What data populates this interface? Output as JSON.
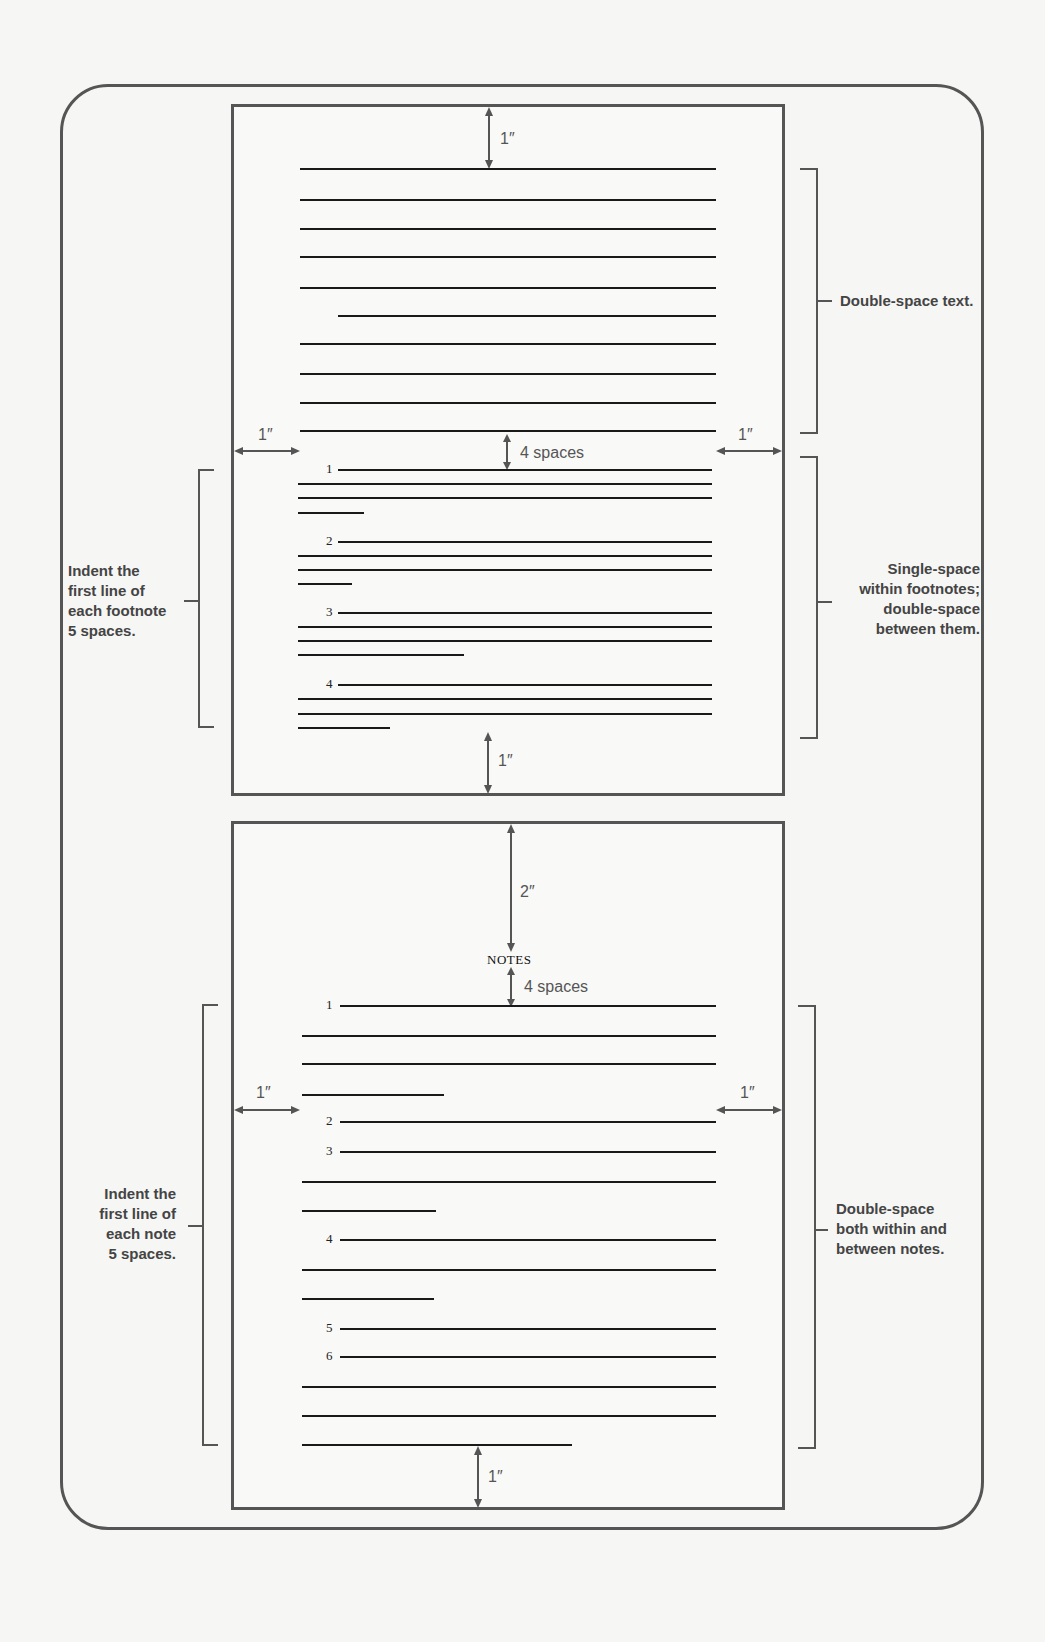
{
  "diagram": {
    "type": "manuscript-page-layout",
    "top_page": {
      "top_margin_label": "1″",
      "bottom_margin_label": "1″",
      "left_margin_label": "1″",
      "right_margin_label": "1″",
      "gap_label": "4 spaces",
      "footnote_numbers": [
        "1",
        "2",
        "3",
        "4"
      ],
      "right_annotation_top": "Double-space text.",
      "right_annotation_bottom": [
        "Single-space",
        "within footnotes;",
        "double-space",
        "between them."
      ],
      "left_annotation": [
        "Indent the",
        "first line of",
        "each footnote",
        "5 spaces."
      ]
    },
    "bottom_page": {
      "top_margin_label": "2″",
      "heading": "NOTES",
      "gap_label": "4 spaces",
      "bottom_margin_label": "1″",
      "left_margin_label": "1″",
      "right_margin_label": "1″",
      "note_numbers": [
        "1",
        "2",
        "3",
        "4",
        "5",
        "6"
      ],
      "right_annotation": [
        "Double-space",
        "both within and",
        "between notes."
      ],
      "left_annotation": [
        "Indent the",
        "first line of",
        "each note",
        "5 spaces."
      ]
    }
  }
}
